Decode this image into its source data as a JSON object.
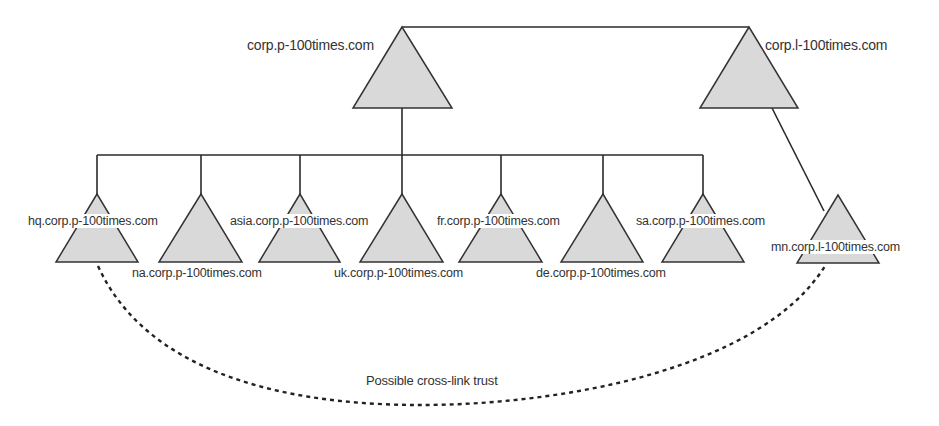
{
  "diagram": {
    "type": "active-directory-forest-trust",
    "colors": {
      "line": "#2a2a2a",
      "triangle_fill": "#d9d9d9",
      "triangle_stroke": "#333333",
      "text": "#333333",
      "background": "#ffffff"
    },
    "roots": [
      {
        "id": "corp-p",
        "label": "corp.p-100times.com"
      },
      {
        "id": "corp-l",
        "label": "corp.l-100times.com"
      }
    ],
    "children_corp_p": [
      {
        "id": "hq",
        "label": "hq.corp.p-100times.com"
      },
      {
        "id": "na",
        "label": "na.corp.p-100times.com"
      },
      {
        "id": "asia",
        "label": "asia.corp.p-100times.com"
      },
      {
        "id": "uk",
        "label": "uk.corp.p-100times.com"
      },
      {
        "id": "fr",
        "label": "fr.corp.p-100times.com"
      },
      {
        "id": "de",
        "label": "de.corp.p-100times.com"
      },
      {
        "id": "sa",
        "label": "sa.corp.p-100times.com"
      }
    ],
    "children_corp_l": [
      {
        "id": "mn",
        "label": "mn.corp.l-100times.com"
      }
    ],
    "cross_link": {
      "from": "hq.corp.p-100times.com",
      "to": "mn.corp.l-100times.com",
      "style": "dashed",
      "label": "Possible cross-link trust"
    }
  }
}
